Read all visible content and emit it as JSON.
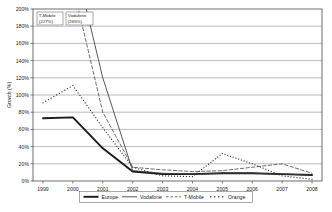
{
  "chart_data": {
    "type": "line",
    "title": "",
    "xlabel": "",
    "ylabel": "Growth (%)",
    "x": [
      1999,
      2000,
      2001,
      2002,
      2003,
      2004,
      2005,
      2006,
      2007,
      2008
    ],
    "xtick_labels": [
      "1999",
      "2000",
      "2001",
      "2002",
      "2003",
      "2004",
      "2005",
      "2006",
      "2007",
      "2008"
    ],
    "ylim": [
      0,
      200
    ],
    "ytick_labels": [
      "0%",
      "20%",
      "40%",
      "60%",
      "80%",
      "100%",
      "120%",
      "140%",
      "160%",
      "180%",
      "200%"
    ],
    "ytick_values": [
      0,
      20,
      40,
      60,
      80,
      100,
      120,
      140,
      160,
      180,
      200
    ],
    "grid": "horizontal",
    "legend_position": "bottom",
    "series": [
      {
        "name": "Europe",
        "style": "solid-thick",
        "color": "#1a1a1a",
        "values": [
          73,
          74,
          38,
          11,
          8,
          8,
          9,
          9,
          8,
          7
        ]
      },
      {
        "name": "Vodafone",
        "style": "solid-thin",
        "color": "#3a3a3a",
        "values": [
          265,
          265,
          120,
          12,
          9,
          8,
          9,
          9,
          8,
          7
        ]
      },
      {
        "name": "T-Mobile",
        "style": "dashed",
        "color": "#555555",
        "values": [
          227,
          227,
          80,
          16,
          13,
          11,
          12,
          16,
          20,
          9
        ]
      },
      {
        "name": "Orange",
        "style": "dotted",
        "color": "#2a2a2a",
        "values": [
          91,
          111,
          62,
          16,
          6,
          5,
          32,
          20,
          6,
          2
        ]
      }
    ],
    "annotations": [
      {
        "id": "t-mobile-peak",
        "line1": "T-Mobile",
        "line2": "(227%)"
      },
      {
        "id": "vodafone-peak",
        "line1": "Vodafone",
        "line2": "(265%)"
      }
    ]
  },
  "legend": {
    "items": [
      {
        "label": "Europe"
      },
      {
        "label": "Vodafone"
      },
      {
        "label": "T-Mobile"
      },
      {
        "label": "Orange"
      }
    ]
  }
}
